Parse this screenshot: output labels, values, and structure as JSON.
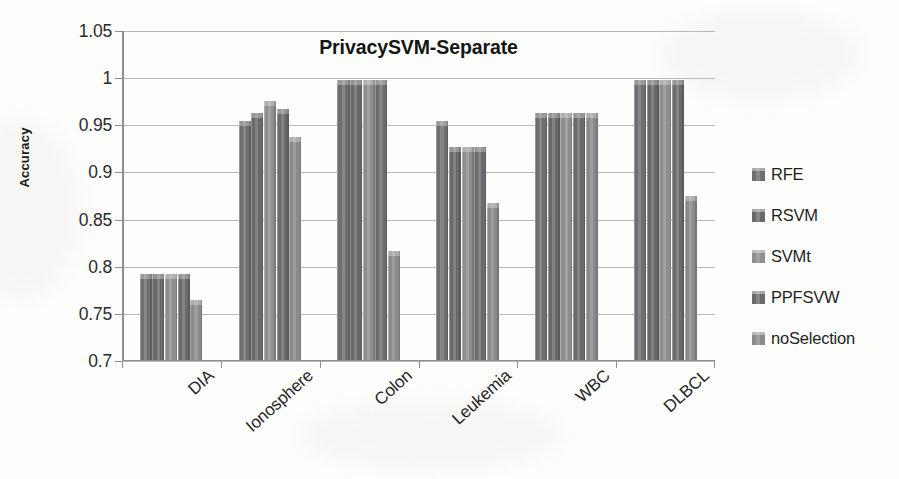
{
  "chart_data": {
    "type": "bar",
    "title": "PrivacySVM-Separate",
    "xlabel": "",
    "ylabel": "Accuracy",
    "ylim": [
      0.7,
      1.05
    ],
    "yticks": [
      0.7,
      0.75,
      0.8,
      0.85,
      0.9,
      0.95,
      1,
      1.05
    ],
    "ytick_labels": [
      "0.7",
      "0.75",
      "0.8",
      "0.85",
      "0.9",
      "0.95",
      "1",
      "1.05"
    ],
    "grid": true,
    "legend_position": "right",
    "categories": [
      "DIA",
      "Ionosphere",
      "Colon",
      "Leukemia",
      "WBC",
      "DLBCL"
    ],
    "series": [
      {
        "name": "RFE",
        "color": "#6e6e6e",
        "values": [
          0.792,
          0.955,
          0.998,
          0.955,
          0.9635,
          0.998
        ]
      },
      {
        "name": "RSVM",
        "color": "#696969",
        "values": [
          0.7925,
          0.9635,
          0.998,
          0.927,
          0.9635,
          0.998
        ]
      },
      {
        "name": "SVMt",
        "color": "#8e8e8e",
        "values": [
          0.792,
          0.9755,
          0.998,
          0.9275,
          0.9635,
          0.998
        ]
      },
      {
        "name": "PPFSVW",
        "color": "#6b6b6b",
        "values": [
          0.7925,
          0.967,
          0.998,
          0.927,
          0.9635,
          0.998
        ]
      },
      {
        "name": "noSelection",
        "color": "#8a8a8a",
        "values": [
          0.7645,
          0.938,
          0.817,
          0.868,
          0.9635,
          0.875
        ]
      }
    ]
  },
  "legend": {
    "items": [
      {
        "label": "RFE",
        "color": "#6e6e6e"
      },
      {
        "label": "RSVM",
        "color": "#696969"
      },
      {
        "label": "SVMt",
        "color": "#8e8e8e"
      },
      {
        "label": "PPFSVW",
        "color": "#6b6b6b"
      },
      {
        "label": "noSelection",
        "color": "#8a8a8a"
      }
    ]
  },
  "axes": {
    "y_title": "Accuracy",
    "tick_0": "0.7",
    "tick_1": "0.75",
    "tick_2": "0.8",
    "tick_3": "0.85",
    "tick_4": "0.9",
    "tick_5": "0.95",
    "tick_6": "1",
    "tick_7": "1.05"
  },
  "colors": {
    "grid": "#b9b9b5",
    "axis": "#8f8f8c",
    "text": "#231f20",
    "background": "#fdfdfc"
  }
}
